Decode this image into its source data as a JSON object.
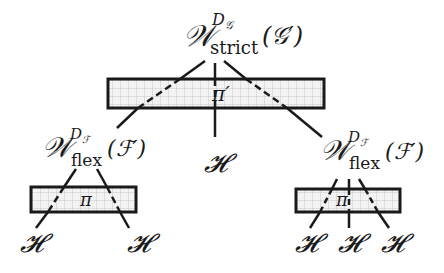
{
  "diagram": {
    "root": {
      "symbol": "𝒲",
      "superscript": "D",
      "superscript_sub": "𝒢",
      "subscript": "strict",
      "argument": "(𝒢′)",
      "projection_label": "π′"
    },
    "children": [
      {
        "symbol": "𝒲",
        "superscript": "D",
        "superscript_sub": "ℱ",
        "subscript": "flex",
        "argument": "(ℱ′)",
        "projection_label": "π",
        "leaves": [
          "𝓗",
          "𝓗"
        ]
      },
      {
        "leaf": "𝓗"
      },
      {
        "symbol": "𝒲",
        "superscript": "D",
        "superscript_sub": "ℱ",
        "subscript": "flex",
        "argument": "(ℱ′)",
        "projection_label": "π",
        "leaves": [
          "𝓗",
          "𝓗",
          "𝓗"
        ]
      }
    ],
    "colors": {
      "stroke": "#1a1a1a",
      "box_fill": "#f3f3f3",
      "grid": "#c8c8c8"
    }
  }
}
